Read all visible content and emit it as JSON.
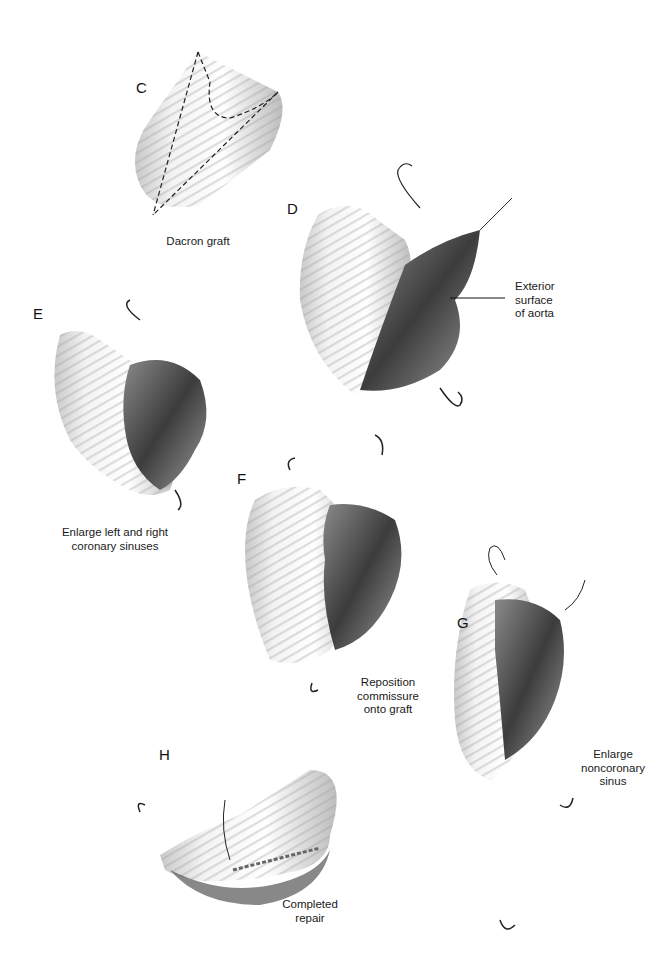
{
  "figure": {
    "panels": [
      {
        "id": "C",
        "letter": "C",
        "caption": [
          "Dacron graft"
        ]
      },
      {
        "id": "D",
        "letter": "D",
        "caption": [
          "Exterior",
          "surface",
          "of aorta"
        ]
      },
      {
        "id": "E",
        "letter": "E",
        "caption": [
          "Enlarge left and right",
          "coronary sinuses"
        ]
      },
      {
        "id": "F",
        "letter": "F",
        "caption": [
          "Reposition",
          "commissure",
          "onto graft"
        ]
      },
      {
        "id": "G",
        "letter": "G",
        "caption": [
          "Enlarge",
          "noncoronary",
          "sinus"
        ]
      },
      {
        "id": "H",
        "letter": "H",
        "caption": [
          "Completed",
          "repair"
        ]
      }
    ]
  }
}
